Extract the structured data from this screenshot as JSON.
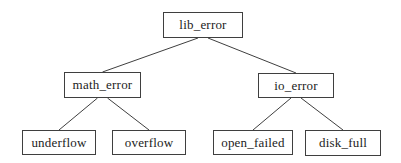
{
  "diagram": {
    "background": "#ffffff",
    "line_color": "#3f3f3f",
    "text_color": "#1c1c1c",
    "root_label": "lib_error",
    "nodes": [
      {
        "id": "lib_error",
        "label": "lib_error",
        "x": 163,
        "y": 12,
        "w": 80,
        "h": 26
      },
      {
        "id": "math_error",
        "label": "math_error",
        "x": 64,
        "y": 72,
        "w": 77,
        "h": 26
      },
      {
        "id": "io_error",
        "label": "io_error",
        "x": 258,
        "y": 73,
        "w": 76,
        "h": 25
      },
      {
        "id": "underflow",
        "label": "underflow",
        "x": 22,
        "y": 130,
        "w": 74,
        "h": 25
      },
      {
        "id": "overflow",
        "label": "overflow",
        "x": 112,
        "y": 130,
        "w": 74,
        "h": 25
      },
      {
        "id": "open_failed",
        "label": "open_failed",
        "x": 213,
        "y": 130,
        "w": 80,
        "h": 25
      },
      {
        "id": "disk_full",
        "label": "disk_full",
        "x": 305,
        "y": 130,
        "w": 76,
        "h": 26
      }
    ],
    "edges": [
      {
        "from": "lib_error",
        "to": "math_error"
      },
      {
        "from": "lib_error",
        "to": "io_error"
      },
      {
        "from": "math_error",
        "to": "underflow"
      },
      {
        "from": "math_error",
        "to": "overflow"
      },
      {
        "from": "io_error",
        "to": "open_failed"
      },
      {
        "from": "io_error",
        "to": "disk_full"
      }
    ]
  }
}
